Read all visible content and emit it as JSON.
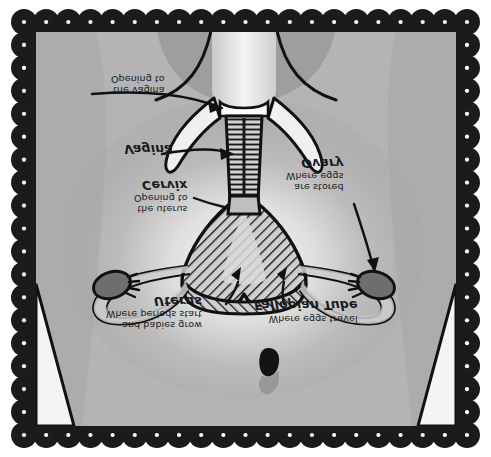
{
  "illustration": {
    "kind": "anatomical-diagram",
    "subject": "female reproductive system",
    "orientation": "vertically flipped (upside-down)",
    "frame_style": "black scalloped border with white dots",
    "colors": {
      "frame": "#1b1b1b",
      "frame_dot": "#ffffff",
      "skin_base": "#b4b4b4",
      "skin_shadow": "#9a9a9a",
      "skin_highlight": "#f2f2f2",
      "organ_outline": "#121212",
      "organ_fill": "#d8d8d8",
      "ovary_fill": "#6e6e6e",
      "label_text": "#1a1a1a"
    }
  },
  "labels": [
    {
      "id": "opening-vagina",
      "title": "",
      "sub_line1": "Opening to",
      "sub_line2": "the vagina"
    },
    {
      "id": "vagina",
      "title": "Vagina",
      "sub_line1": "",
      "sub_line2": ""
    },
    {
      "id": "cervix",
      "title": "Cervix",
      "sub_line1": "Opening to",
      "sub_line2": "the uterus"
    },
    {
      "id": "ovary",
      "title": "Ovary",
      "sub_line1": "Where eggs",
      "sub_line2": "are stored"
    },
    {
      "id": "uterus",
      "title": "Uterus",
      "sub_line1": "Where periods start",
      "sub_line2": "and babies grow"
    },
    {
      "id": "fallopian-tube",
      "title": "Fallopian Tube",
      "sub_line1": "Where eggs travel",
      "sub_line2": ""
    }
  ],
  "label_text": {
    "opening_vagina_l1": "Opening to",
    "opening_vagina_l2": "the vagina",
    "vagina_title": "Vagina",
    "cervix_title": "Cervix",
    "cervix_l1": "Opening to",
    "cervix_l2": "the uterus",
    "ovary_title": "Ovary",
    "ovary_l1": "Where eggs",
    "ovary_l2": "are stored",
    "uterus_title": "Uterus",
    "uterus_l1": "Where periods start",
    "uterus_l2": "and babies grow",
    "fallopian_title": "Fallopian Tube",
    "fallopian_l1": "Where eggs travel"
  },
  "anatomy_parts": [
    "vaginal-opening",
    "vaginal-canal",
    "cervix",
    "uterus",
    "fallopian-tube-left",
    "fallopian-tube-right",
    "ovary-left",
    "ovary-right",
    "navel",
    "torso",
    "thigh-left",
    "thigh-right"
  ]
}
